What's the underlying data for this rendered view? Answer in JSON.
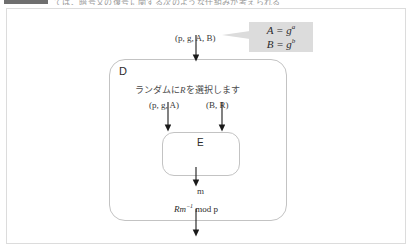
{
  "header": {
    "swatch_color": "#6f6f6f",
    "text": "ては、暗号文の復号に関する次のような仕組みが考えられる"
  },
  "panel": {
    "background": "#ffffff",
    "border_color": "#dcdcdc"
  },
  "diagram": {
    "callout": {
      "background": "#dcdcdc",
      "line1_base": "A = g",
      "line1_exp": "a",
      "line2_base": "B = g",
      "line2_exp": "b"
    },
    "input_label_top": "(p, g, A, B)",
    "outer_box": {
      "label": "D",
      "instruction_prefix": "ランダムに",
      "instruction_var": "R",
      "instruction_suffix": "を選択します"
    },
    "branch_labels": {
      "left": "(p, g, A)",
      "right": "(B, R)"
    },
    "inner_box": {
      "label": "E"
    },
    "output_label": "m",
    "formula": {
      "lead": "Rm",
      "exponent": "−1",
      "tail": " mod p"
    }
  },
  "colors": {
    "box_border": "#c3c3c3",
    "arrow": "#1a1a1a",
    "text": "#2b2b2b",
    "muted_text": "#9a9a9a"
  }
}
